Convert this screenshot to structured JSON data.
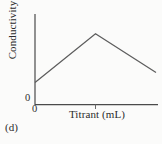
{
  "figure": {
    "panel_label": "(d)",
    "background_color": "#fbfbfa",
    "line_color": "#5d5d5d",
    "axis_color": "#4a4a4a"
  },
  "chart_data": {
    "type": "line",
    "title": "",
    "subtitle": "",
    "xlabel": "Titrant (mL)",
    "ylabel": "Conductivity",
    "x_origin_label": "0",
    "y_origin_label": "0",
    "grid": false,
    "legend": null,
    "xlim": [
      0,
      4
    ],
    "ylim": [
      0,
      4
    ],
    "xticks": [
      0,
      2
    ],
    "xticklabels": [
      "0",
      ""
    ],
    "yticks": [
      0
    ],
    "yticklabels": [
      "0"
    ],
    "series": [
      {
        "name": "Conductivity vs titrant volume",
        "x": [
          0,
          2,
          4
        ],
        "values": [
          1.0,
          3.2,
          1.45
        ]
      }
    ],
    "annotations": [
      {
        "name": "equivalence-point-tick",
        "x": 2,
        "description": "unlabeled tick mark on x-axis at the conductivity maximum"
      }
    ]
  }
}
